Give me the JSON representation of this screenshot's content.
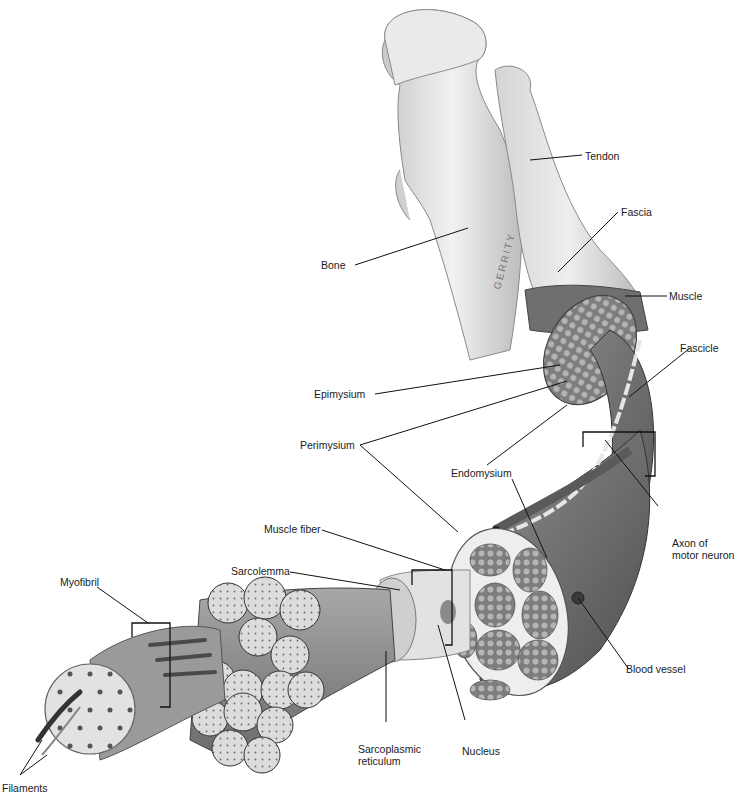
{
  "diagram": {
    "signature": "GERRITY",
    "colors": {
      "background": "#ffffff",
      "bone": "#e6e6e6",
      "bone_shadow": "#9a9a9a",
      "tendon": "#dcdcdc",
      "muscle": "#7a7a7a",
      "muscle_dark": "#555555",
      "fascicle_fill": "#8c8c8c",
      "myofibril_fill": "#d0d0d0",
      "leader_line": "#111111",
      "label_text": "#1a1a1a"
    },
    "labels": {
      "tendon": "Tendon",
      "fascia": "Fascia",
      "bone": "Bone",
      "muscle": "Muscle",
      "epimysium": "Epimysium",
      "fascicle": "Fascicle",
      "perimysium": "Perimysium",
      "endomysium": "Endomysium",
      "axon": "Axon of\nmotor neuron",
      "muscle_fiber": "Muscle fiber",
      "sarcolemma": "Sarcolemma",
      "myofibril": "Myofibril",
      "blood_vessel": "Blood vessel",
      "sarcoplasmic_reticulum": "Sarcoplasmic\nreticulum",
      "nucleus": "Nucleus",
      "filaments": "Filaments"
    }
  }
}
